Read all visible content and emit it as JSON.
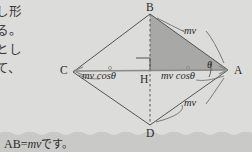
{
  "page": {
    "background_color": "#dcdcda",
    "ink_color": "#2b2b29",
    "shade_color": "#a8a8a6"
  },
  "side_text": {
    "lines": [
      "し形",
      "る。",
      "とし",
      "て、"
    ]
  },
  "caption": {
    "prefix": "AB",
    "equals": "=",
    "quantity": "mv",
    "suffix": "です。"
  },
  "diagram": {
    "type": "rhombus-momentum-vector",
    "points": [
      {
        "id": "B",
        "label": "B",
        "x": 150,
        "y": 14
      },
      {
        "id": "A",
        "label": "A",
        "x": 228,
        "y": 70
      },
      {
        "id": "C",
        "label": "C",
        "x": 73,
        "y": 72
      },
      {
        "id": "D",
        "label": "D",
        "x": 150,
        "y": 125
      },
      {
        "id": "H",
        "label": "H",
        "x": 150,
        "y": 71
      }
    ],
    "angle": {
      "label": "θ",
      "at": "A"
    },
    "vector_labels": [
      {
        "label": "mv",
        "position": "upper-right",
        "x": 190,
        "y": 31
      },
      {
        "label": "mv",
        "position": "lower-right",
        "x": 190,
        "y": 103
      }
    ],
    "component_labels": [
      {
        "label": "mv cosθ",
        "position": "left-of-H",
        "x": 88,
        "y": 73
      },
      {
        "label": "mv cosθ",
        "position": "right-of-H",
        "x": 165,
        "y": 73
      }
    ],
    "markers": {
      "right_angle_at": "H",
      "dashed_axis": "B-H-D",
      "shaded_triangle": [
        "B",
        "H",
        "A"
      ]
    }
  }
}
